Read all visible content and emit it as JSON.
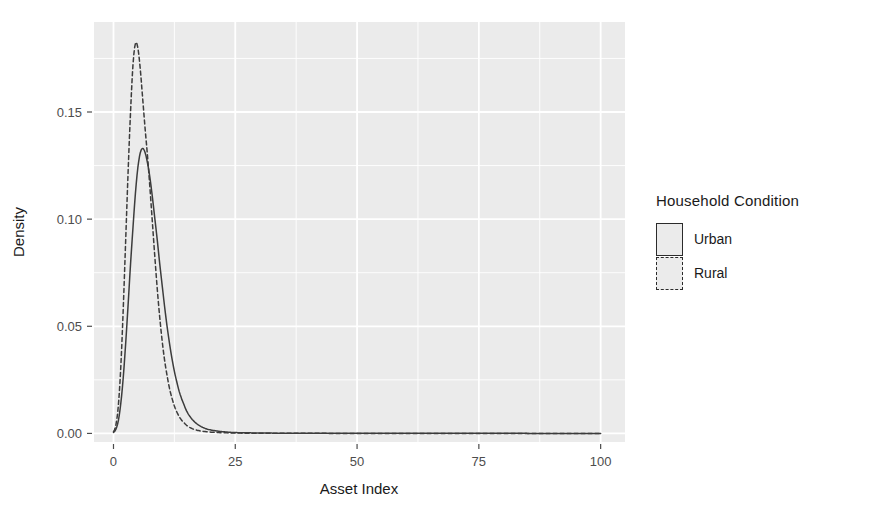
{
  "chart_data": {
    "type": "line",
    "title": "",
    "subtitle": "",
    "xlabel": "Asset Index",
    "ylabel": "Density",
    "xlim": [
      -4,
      105
    ],
    "ylim": [
      -0.004,
      0.192
    ],
    "xticks": [
      "0",
      "25",
      "50",
      "75",
      "100"
    ],
    "xtick_values": [
      0,
      25,
      50,
      75,
      100
    ],
    "yticks": [
      "0.00",
      "0.05",
      "0.10",
      "0.15"
    ],
    "ytick_values": [
      0.0,
      0.05,
      0.1,
      0.15
    ],
    "grid": true,
    "legend_position": "right",
    "legend_title": "Household Condition",
    "panel_background": "#ebebeb",
    "gridline_color": "#ffffff",
    "line_color": "#3c3c3c",
    "series": [
      {
        "name": "Urban",
        "linestyle": "solid",
        "peak_x": 6.0,
        "peak_y": 0.133,
        "x": [
          0.0,
          0.5,
          1.0,
          1.5,
          2.0,
          2.5,
          3.0,
          3.5,
          4.0,
          4.5,
          5.0,
          5.5,
          6.0,
          6.5,
          7.0,
          7.5,
          8.0,
          8.5,
          9.0,
          9.5,
          10.0,
          10.5,
          11.0,
          11.5,
          12.0,
          12.5,
          13.0,
          13.5,
          14.0,
          15.0,
          16.0,
          17.0,
          18.0,
          19.0,
          20.0,
          21.0,
          22.0,
          23.0,
          24.0,
          25.0,
          27.0,
          30.0,
          35.0,
          40.0,
          50.0,
          60.0,
          70.0,
          80.0,
          90.0,
          100.0
        ],
        "y": [
          0.0005,
          0.002,
          0.006,
          0.014,
          0.026,
          0.042,
          0.06,
          0.079,
          0.096,
          0.112,
          0.124,
          0.131,
          0.133,
          0.131,
          0.126,
          0.119,
          0.11,
          0.1,
          0.09,
          0.079,
          0.069,
          0.059,
          0.05,
          0.042,
          0.035,
          0.029,
          0.024,
          0.0195,
          0.016,
          0.0105,
          0.007,
          0.0047,
          0.0032,
          0.0022,
          0.0016,
          0.0012,
          0.0009,
          0.0007,
          0.0005,
          0.0004,
          0.0003,
          0.0002,
          0.0001,
          0.0001,
          5e-05,
          4e-05,
          3e-05,
          3e-05,
          2e-05,
          2e-05
        ]
      },
      {
        "name": "Rural",
        "linestyle": "dashed",
        "peak_x": 4.5,
        "peak_y": 0.182,
        "x": [
          0.0,
          0.5,
          1.0,
          1.5,
          2.0,
          2.5,
          3.0,
          3.5,
          4.0,
          4.5,
          5.0,
          5.5,
          6.0,
          6.5,
          7.0,
          7.5,
          8.0,
          8.5,
          9.0,
          9.5,
          10.0,
          10.5,
          11.0,
          11.5,
          12.0,
          12.5,
          13.0,
          13.5,
          14.0,
          15.0,
          16.0,
          17.0,
          18.0,
          19.0,
          20.0,
          21.0,
          22.0,
          23.0,
          24.0,
          25.0,
          27.0,
          30.0,
          35.0,
          40.0,
          50.0,
          60.0,
          70.0,
          80.0,
          90.0,
          100.0
        ],
        "y": [
          0.0008,
          0.004,
          0.013,
          0.031,
          0.058,
          0.09,
          0.122,
          0.15,
          0.172,
          0.182,
          0.18,
          0.17,
          0.156,
          0.142,
          0.129,
          0.114,
          0.098,
          0.082,
          0.067,
          0.054,
          0.043,
          0.034,
          0.027,
          0.021,
          0.0165,
          0.0128,
          0.01,
          0.0078,
          0.0061,
          0.0038,
          0.0024,
          0.0016,
          0.0011,
          0.0008,
          0.0006,
          0.00045,
          0.00035,
          0.00028,
          0.00022,
          0.00018,
          0.00012,
          8e-05,
          5e-05,
          3e-05,
          2e-05,
          2e-05,
          1e-05,
          1e-05,
          1e-05,
          1e-05
        ]
      }
    ]
  },
  "axes": {
    "x_title": "Asset Index",
    "y_title": "Density",
    "x_tick_labels": [
      "0",
      "25",
      "50",
      "75",
      "100"
    ],
    "y_tick_labels": [
      "0.00",
      "0.05",
      "0.10",
      "0.15"
    ]
  },
  "legend": {
    "title": "Household Condition",
    "entries": [
      {
        "label": "Urban",
        "style": "solid"
      },
      {
        "label": "Rural",
        "style": "dashed"
      }
    ]
  }
}
